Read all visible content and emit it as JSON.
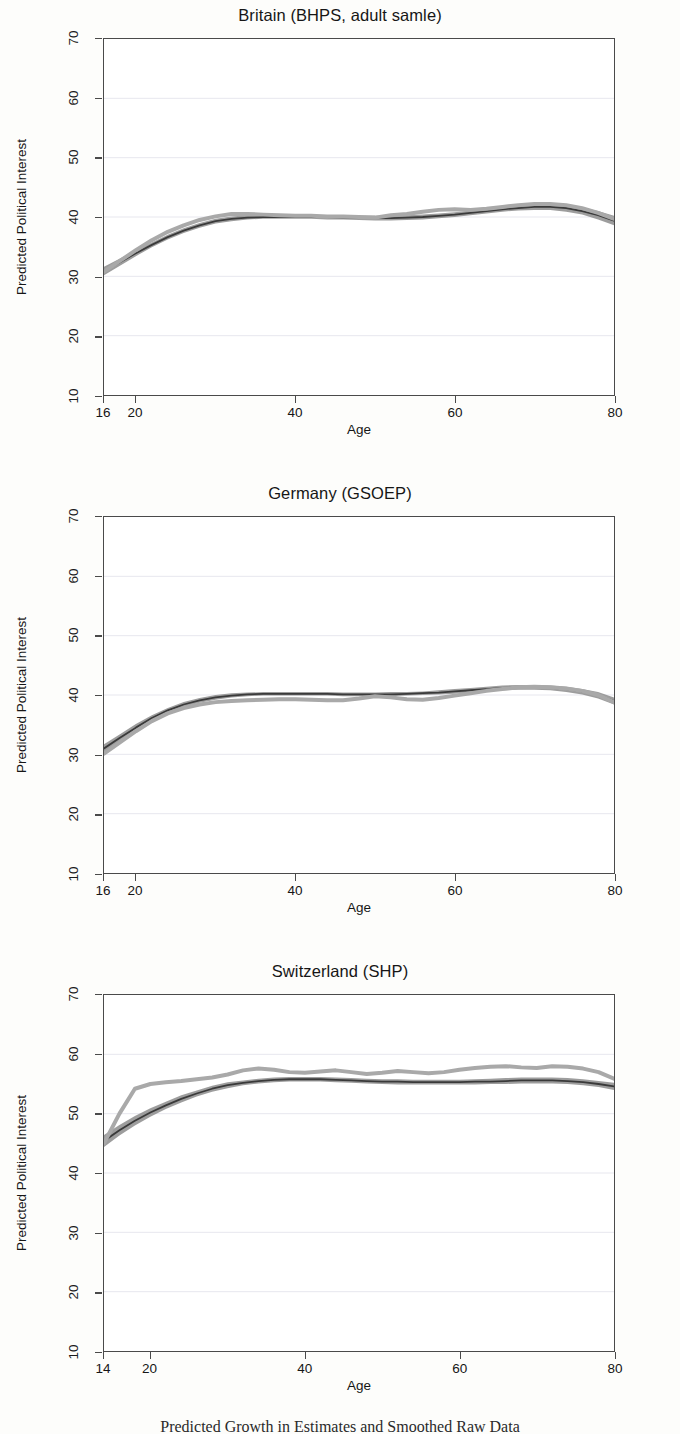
{
  "figure": {
    "ylabel": "Predicted Political Interest",
    "xlabel": "Age",
    "caption": "Predicted Growth in Estimates and Smoothed Raw Data"
  },
  "colors": {
    "dark_line": "#3a3a3a",
    "band": "#8c8c8c",
    "light_line": "#a9a9a9",
    "frame": "#4a4a4a",
    "grid": "#e7e7ee",
    "background": "#ffffff"
  },
  "panels": [
    {
      "title": "Britain (BHPS, adult samle)",
      "xticks": [
        16,
        20,
        40,
        60,
        80
      ],
      "yticks": [
        10,
        20,
        30,
        40,
        50,
        60,
        70
      ]
    },
    {
      "title": "Germany (GSOEP)",
      "xticks": [
        16,
        20,
        40,
        60,
        80
      ],
      "yticks": [
        10,
        20,
        30,
        40,
        50,
        60,
        70
      ]
    },
    {
      "title": "Switzerland (SHP)",
      "xticks": [
        14,
        20,
        40,
        60,
        80
      ],
      "yticks": [
        10,
        20,
        30,
        40,
        50,
        60,
        70
      ]
    }
  ],
  "chart_data": [
    {
      "type": "line",
      "title": "Britain (BHPS, adult samle)",
      "xlabel": "Age",
      "ylabel": "Predicted Political Interest",
      "xlim": [
        16,
        80
      ],
      "ylim": [
        10,
        70
      ],
      "grid": true,
      "legend": "none",
      "x": [
        16,
        18,
        20,
        22,
        24,
        26,
        28,
        30,
        32,
        34,
        36,
        38,
        40,
        42,
        44,
        46,
        48,
        50,
        52,
        54,
        56,
        58,
        60,
        62,
        64,
        66,
        68,
        70,
        72,
        74,
        76,
        78,
        80
      ],
      "series": [
        {
          "name": "Predicted (model estimate)",
          "color": "#3a3a3a",
          "values": [
            30.9,
            32.4,
            33.9,
            35.3,
            36.6,
            37.7,
            38.6,
            39.3,
            39.7,
            39.9,
            40.0,
            40.0,
            40.0,
            40.0,
            40.0,
            39.9,
            39.9,
            39.8,
            39.8,
            39.9,
            40.0,
            40.2,
            40.4,
            40.7,
            41.0,
            41.3,
            41.5,
            41.7,
            41.7,
            41.5,
            41.0,
            40.3,
            39.4
          ],
          "band_lower": [
            30.2,
            31.8,
            33.4,
            34.9,
            36.2,
            37.3,
            38.2,
            38.9,
            39.3,
            39.6,
            39.7,
            39.7,
            39.7,
            39.7,
            39.6,
            39.6,
            39.5,
            39.4,
            39.4,
            39.5,
            39.6,
            39.8,
            40.0,
            40.3,
            40.6,
            40.9,
            41.1,
            41.2,
            41.2,
            40.9,
            40.4,
            39.6,
            38.6
          ],
          "band_upper": [
            31.6,
            33.0,
            34.4,
            35.7,
            37.0,
            38.1,
            39.0,
            39.7,
            40.1,
            40.3,
            40.4,
            40.4,
            40.4,
            40.3,
            40.3,
            40.2,
            40.2,
            40.2,
            40.2,
            40.3,
            40.4,
            40.6,
            40.8,
            41.1,
            41.4,
            41.7,
            41.9,
            42.1,
            42.2,
            42.0,
            41.6,
            41.0,
            40.2
          ]
        },
        {
          "name": "Smoothed raw data",
          "color": "#a9a9a9",
          "values": [
            30.8,
            32.6,
            34.4,
            36.1,
            37.5,
            38.6,
            39.5,
            40.1,
            40.5,
            40.5,
            40.4,
            40.3,
            40.2,
            40.2,
            40.1,
            40.1,
            40.0,
            39.9,
            40.3,
            40.5,
            40.9,
            41.2,
            41.3,
            41.2,
            41.4,
            41.7,
            42.0,
            42.2,
            42.2,
            42.0,
            41.5,
            40.7,
            39.7
          ]
        }
      ]
    },
    {
      "type": "line",
      "title": "Germany (GSOEP)",
      "xlabel": "Age",
      "ylabel": "Predicted Political Interest",
      "xlim": [
        16,
        80
      ],
      "ylim": [
        10,
        70
      ],
      "grid": true,
      "legend": "none",
      "x": [
        16,
        18,
        20,
        22,
        24,
        26,
        28,
        30,
        32,
        34,
        36,
        38,
        40,
        42,
        44,
        46,
        48,
        50,
        52,
        54,
        56,
        58,
        60,
        62,
        64,
        66,
        68,
        70,
        72,
        74,
        76,
        78,
        80
      ],
      "series": [
        {
          "name": "Predicted (model estimate)",
          "color": "#3a3a3a",
          "values": [
            31.0,
            32.8,
            34.5,
            36.1,
            37.4,
            38.4,
            39.1,
            39.6,
            39.9,
            40.1,
            40.2,
            40.2,
            40.2,
            40.2,
            40.2,
            40.1,
            40.1,
            40.1,
            40.1,
            40.2,
            40.3,
            40.4,
            40.6,
            40.8,
            41.0,
            41.2,
            41.3,
            41.3,
            41.2,
            41.0,
            40.6,
            40.0,
            39.0
          ],
          "band_lower": [
            30.3,
            32.2,
            33.9,
            35.6,
            37.0,
            38.0,
            38.7,
            39.2,
            39.6,
            39.8,
            39.9,
            39.9,
            39.9,
            39.9,
            39.9,
            39.8,
            39.8,
            39.8,
            39.8,
            39.9,
            40.0,
            40.1,
            40.2,
            40.4,
            40.6,
            40.8,
            40.9,
            40.9,
            40.8,
            40.5,
            40.1,
            39.4,
            38.4
          ],
          "band_upper": [
            31.7,
            33.4,
            35.1,
            36.6,
            37.8,
            38.8,
            39.5,
            40.0,
            40.3,
            40.4,
            40.5,
            40.5,
            40.5,
            40.5,
            40.5,
            40.4,
            40.4,
            40.4,
            40.5,
            40.5,
            40.6,
            40.8,
            41.0,
            41.2,
            41.4,
            41.6,
            41.7,
            41.7,
            41.6,
            41.4,
            41.0,
            40.5,
            39.6
          ]
        },
        {
          "name": "Smoothed raw data",
          "color": "#a9a9a9",
          "values": [
            30.1,
            32.0,
            33.9,
            35.6,
            36.9,
            37.8,
            38.4,
            38.8,
            39.0,
            39.1,
            39.2,
            39.3,
            39.3,
            39.2,
            39.1,
            39.1,
            39.4,
            39.8,
            39.6,
            39.3,
            39.2,
            39.5,
            39.9,
            40.3,
            40.7,
            41.0,
            41.3,
            41.4,
            41.3,
            41.1,
            40.7,
            40.0,
            38.8
          ]
        }
      ]
    },
    {
      "type": "line",
      "title": "Switzerland (SHP)",
      "xlabel": "Age",
      "ylabel": "Predicted Political Interest",
      "xlim": [
        14,
        80
      ],
      "ylim": [
        10,
        70
      ],
      "grid": true,
      "legend": "none",
      "x": [
        14,
        16,
        18,
        20,
        22,
        24,
        26,
        28,
        30,
        32,
        34,
        36,
        38,
        40,
        42,
        44,
        46,
        48,
        50,
        52,
        54,
        56,
        58,
        60,
        62,
        64,
        66,
        68,
        70,
        72,
        74,
        76,
        78,
        80
      ],
      "series": [
        {
          "name": "Predicted (model estimate)",
          "color": "#3a3a3a",
          "values": [
            45.4,
            47.2,
            48.8,
            50.2,
            51.4,
            52.5,
            53.4,
            54.2,
            54.8,
            55.2,
            55.5,
            55.7,
            55.8,
            55.8,
            55.8,
            55.7,
            55.6,
            55.5,
            55.4,
            55.4,
            55.3,
            55.3,
            55.3,
            55.3,
            55.4,
            55.4,
            55.5,
            55.6,
            55.6,
            55.6,
            55.5,
            55.3,
            55.0,
            54.6
          ],
          "band_lower": [
            44.4,
            46.3,
            48.0,
            49.5,
            50.8,
            51.9,
            52.9,
            53.7,
            54.3,
            54.8,
            55.1,
            55.3,
            55.4,
            55.4,
            55.4,
            55.3,
            55.2,
            55.1,
            55.0,
            54.9,
            54.9,
            54.9,
            54.9,
            54.9,
            54.9,
            55.0,
            55.0,
            55.1,
            55.1,
            55.1,
            55.0,
            54.8,
            54.5,
            54.0
          ],
          "band_upper": [
            46.4,
            48.1,
            49.6,
            50.9,
            52.0,
            53.1,
            53.9,
            54.7,
            55.3,
            55.6,
            55.9,
            56.1,
            56.2,
            56.2,
            56.2,
            56.1,
            56.0,
            55.9,
            55.8,
            55.8,
            55.7,
            55.7,
            55.7,
            55.7,
            55.8,
            55.9,
            56.0,
            56.1,
            56.1,
            56.1,
            56.0,
            55.8,
            55.5,
            55.2
          ]
        },
        {
          "name": "Smoothed raw data",
          "color": "#a9a9a9",
          "values": [
            45.0,
            50.0,
            54.2,
            55.0,
            55.3,
            55.5,
            55.8,
            56.1,
            56.6,
            57.3,
            57.6,
            57.4,
            57.0,
            56.9,
            57.1,
            57.3,
            57.0,
            56.7,
            56.9,
            57.2,
            57.0,
            56.8,
            57.0,
            57.4,
            57.7,
            57.9,
            58.0,
            57.8,
            57.7,
            58.0,
            57.9,
            57.6,
            57.0,
            55.9
          ]
        }
      ]
    }
  ]
}
